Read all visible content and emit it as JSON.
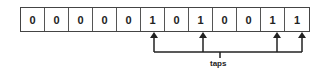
{
  "diagram": {
    "bits": [
      "0",
      "0",
      "0",
      "0",
      "0",
      "1",
      "0",
      "1",
      "0",
      "0",
      "1",
      "1"
    ],
    "tap_indices": [
      5,
      7,
      10,
      11
    ],
    "tap_label": "taps",
    "colors": {
      "line": "#222222",
      "border": "#444444",
      "text": "#222222"
    }
  }
}
